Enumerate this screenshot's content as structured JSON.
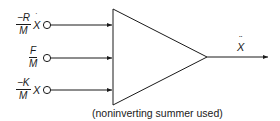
{
  "diagram": {
    "type": "noninverting summer block",
    "inputs": [
      {
        "numerator": "−R",
        "denominator": "M",
        "variable": "X",
        "variable_mark": "˙",
        "description": "-R/M Ẋ"
      },
      {
        "numerator": "F",
        "denominator": "M",
        "variable": "",
        "variable_mark": "",
        "description": "F/M"
      },
      {
        "numerator": "−K",
        "denominator": "M",
        "variable": "X",
        "variable_mark": "",
        "description": "-K/M X"
      }
    ],
    "output": {
      "variable": "X",
      "variable_mark": "¨",
      "description": "Ẍ"
    },
    "caption": "(noninverting summer used)"
  }
}
